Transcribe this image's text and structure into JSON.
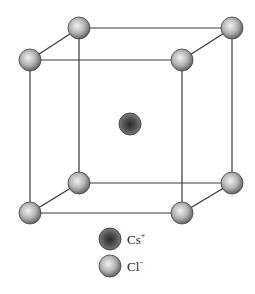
{
  "diagram": {
    "colors": {
      "edge": "#3a3a3a",
      "cl_light": "#e6e6e6",
      "cl_dark": "#6a6a6a",
      "cs_light": "#3a3a3a",
      "cs_dark": "#8c8c8c",
      "background": "#ffffff"
    },
    "nodes": {
      "corners": [
        {
          "id": "top-back-left",
          "x": 79,
          "y": 28
        },
        {
          "id": "top-back-right",
          "x": 232,
          "y": 28
        },
        {
          "id": "top-front-left",
          "x": 30,
          "y": 60
        },
        {
          "id": "top-front-right",
          "x": 182,
          "y": 60
        },
        {
          "id": "bottom-back-left",
          "x": 79,
          "y": 183
        },
        {
          "id": "bottom-back-right",
          "x": 232,
          "y": 183
        },
        {
          "id": "bottom-front-left",
          "x": 30,
          "y": 213
        },
        {
          "id": "bottom-front-right",
          "x": 182,
          "y": 213
        }
      ],
      "center": {
        "id": "body-center",
        "x": 130,
        "y": 124
      },
      "radius": 11
    },
    "legend": [
      {
        "ion": "cs",
        "label": "Cs",
        "charge": "+"
      },
      {
        "ion": "cl",
        "label": "Cl",
        "charge": "−"
      }
    ]
  }
}
